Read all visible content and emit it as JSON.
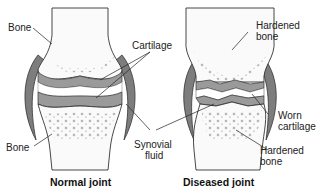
{
  "diagram": {
    "type": "anatomical-comparison",
    "panels": [
      {
        "id": "normal",
        "caption": "Normal joint",
        "labels": {
          "bone_top": "Bone",
          "bone_bottom": "Bone",
          "cartilage": "Cartilage"
        }
      },
      {
        "id": "diseased",
        "caption": "Diseased joint",
        "labels": {
          "hardened_top_1": "Hardened",
          "hardened_top_2": "bone",
          "worn_1": "Worn",
          "worn_2": "cartilage",
          "hardened_bottom_1": "Hardened",
          "hardened_bottom_2": "bone"
        }
      }
    ],
    "shared_labels": {
      "synovial_1": "Synovial",
      "synovial_2": "fluid"
    },
    "colors": {
      "outline": "#333333",
      "cartilage_fill": "#9a9a9a",
      "capsule_fill": "#7d7d7d",
      "bone_fill": "#fafafa",
      "background": "#ffffff"
    }
  }
}
